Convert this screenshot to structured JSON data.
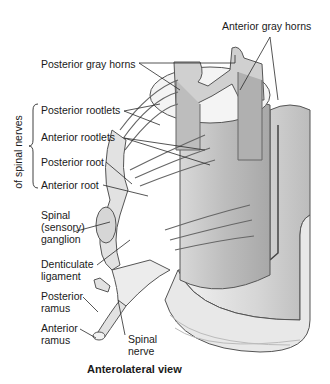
{
  "diagram": {
    "caption": "Anterolateral view",
    "bracket_label": "of spinal nerves",
    "labels": {
      "anterior_gray_horns": "Anterior gray horns",
      "posterior_gray_horns": "Posterior gray horns",
      "posterior_rootlets": "Posterior rootlets",
      "anterior_rootlets": "Anterior rootlets",
      "posterior_root": "Posterior root",
      "anterior_root": "Anterior root",
      "spinal_ganglion": "Spinal\n(sensory)\nganglion",
      "denticulate_ligament": "Denticulate\nligament",
      "posterior_ramus": "Posterior\nramus",
      "anterior_ramus": "Anterior\nramus",
      "spinal_nerve": "Spinal\nnerve"
    },
    "colors": {
      "line": "#2a2a2a",
      "tissue_light": "#e6e6e6",
      "tissue_mid": "#c4c4c4",
      "tissue_dark": "#9a9a9a"
    }
  }
}
